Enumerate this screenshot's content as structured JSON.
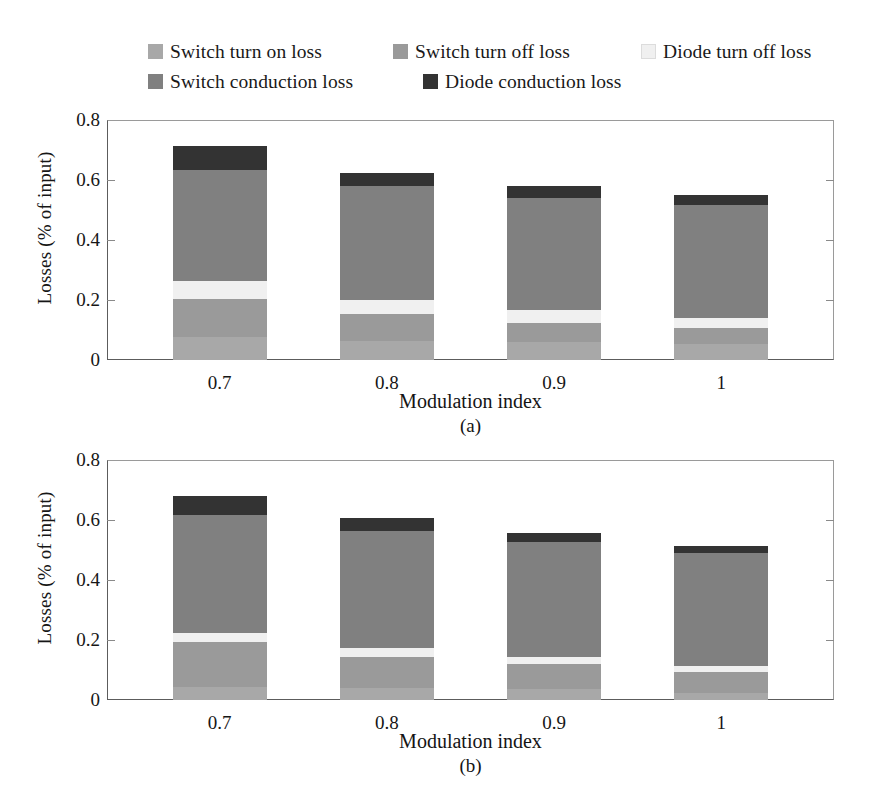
{
  "figure": {
    "ylabel": "Losses (% of input)",
    "xlabel": "Modulation index",
    "caption_a": "(a)",
    "caption_b": "(b)"
  },
  "legend": {
    "rows": [
      [
        {
          "label": "Switch turn on loss",
          "color": "#a8a8a8",
          "key": "switch_turn_on"
        },
        {
          "label": "Switch turn off loss",
          "color": "#9a9a9a",
          "key": "switch_turn_off"
        },
        {
          "label": "Diode turn off loss",
          "color": "#f0f0f0",
          "key": "diode_turn_off"
        }
      ],
      [
        {
          "label": "Switch conduction loss",
          "color": "#808080",
          "key": "switch_conduction"
        },
        {
          "label": "Diode conduction loss",
          "color": "#333333",
          "key": "diode_conduction"
        }
      ]
    ]
  },
  "axis": {
    "yticks": [
      "0",
      "0.2",
      "0.4",
      "0.6",
      "0.8"
    ],
    "ytick_values": [
      0,
      0.2,
      0.4,
      0.6,
      0.8
    ],
    "ylim": [
      0,
      0.8
    ],
    "xticks": [
      "0.7",
      "0.8",
      "0.9",
      "1"
    ]
  },
  "chart_data": [
    {
      "type": "bar",
      "id": "a",
      "stacked": true,
      "title": "(a)",
      "xlabel": "Modulation index",
      "ylabel": "Losses (% of input)",
      "ylim": [
        0,
        0.8
      ],
      "yticks": [
        0,
        0.2,
        0.4,
        0.6,
        0.8
      ],
      "grid": false,
      "legend_position": "above-plot",
      "categories": [
        "0.7",
        "0.8",
        "0.9",
        "1"
      ],
      "series": [
        {
          "name": "Switch turn on loss",
          "color": "#a8a8a8",
          "values": [
            0.078,
            0.063,
            0.059,
            0.054
          ]
        },
        {
          "name": "Switch turn off loss",
          "color": "#9a9a9a",
          "values": [
            0.127,
            0.091,
            0.066,
            0.053
          ]
        },
        {
          "name": "Diode turn off loss",
          "color": "#f0f0f0",
          "values": [
            0.059,
            0.047,
            0.041,
            0.033
          ]
        },
        {
          "name": "Switch conduction loss",
          "color": "#808080",
          "values": [
            0.369,
            0.379,
            0.374,
            0.378
          ]
        },
        {
          "name": "Diode conduction loss",
          "color": "#333333",
          "values": [
            0.081,
            0.045,
            0.04,
            0.032
          ]
        }
      ],
      "totals": [
        0.714,
        0.625,
        0.58,
        0.55
      ]
    },
    {
      "type": "bar",
      "id": "b",
      "stacked": true,
      "title": "(b)",
      "xlabel": "Modulation index",
      "ylabel": "Losses (% of input)",
      "ylim": [
        0,
        0.8
      ],
      "yticks": [
        0,
        0.2,
        0.4,
        0.6,
        0.8
      ],
      "grid": false,
      "legend_position": "above-plot",
      "categories": [
        "0.7",
        "0.8",
        "0.9",
        "1"
      ],
      "series": [
        {
          "name": "Switch turn on loss",
          "color": "#a8a8a8",
          "values": [
            0.043,
            0.041,
            0.036,
            0.022
          ]
        },
        {
          "name": "Switch turn off loss",
          "color": "#9a9a9a",
          "values": [
            0.152,
            0.104,
            0.083,
            0.072
          ]
        },
        {
          "name": "Diode turn off loss",
          "color": "#f0f0f0",
          "values": [
            0.03,
            0.029,
            0.025,
            0.021
          ]
        },
        {
          "name": "Switch conduction loss",
          "color": "#808080",
          "values": [
            0.393,
            0.39,
            0.382,
            0.374
          ]
        },
        {
          "name": "Diode conduction loss",
          "color": "#333333",
          "values": [
            0.062,
            0.042,
            0.03,
            0.023
          ]
        }
      ],
      "totals": [
        0.68,
        0.606,
        0.556,
        0.512
      ]
    }
  ]
}
